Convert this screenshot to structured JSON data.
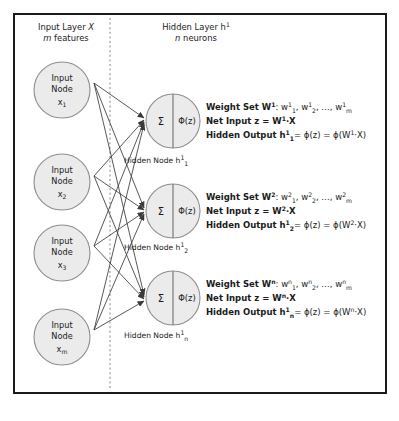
{
  "diagram": {
    "type": "neural-network-architecture",
    "headers": {
      "input_layer": {
        "line1_prefix": "Input Layer ",
        "line1_italic": "X",
        "line2_italic": "m",
        "line2_rest": " features"
      },
      "hidden_layer": {
        "line1_prefix": "Hidden Layer h",
        "line1_sup": "1",
        "line2_italic": "n",
        "line2_rest": " neurons"
      }
    },
    "input_nodes": [
      {
        "line1": "Input",
        "line2": "Node",
        "var": "x",
        "sub": "1"
      },
      {
        "line1": "Input",
        "line2": "Node",
        "var": "x",
        "sub": "2"
      },
      {
        "line1": "Input",
        "line2": "Node",
        "var": "x",
        "sub": "3"
      },
      {
        "line1": "Input",
        "line2": "Node",
        "var": "x",
        "sub": "m"
      }
    ],
    "hidden_nodes": [
      {
        "sum_symbol": "Σ",
        "activation_symbol": "Φ(z)",
        "label_prefix": "Hidden Node h",
        "label_sup": "1",
        "label_sub": "1"
      },
      {
        "sum_symbol": "Σ",
        "activation_symbol": "Φ(z)",
        "label_prefix": "Hidden Node h",
        "label_sup": "1",
        "label_sub": "2"
      },
      {
        "sum_symbol": "Σ",
        "activation_symbol": "Φ(z)",
        "label_prefix": "Hidden Node h",
        "label_sup": "1",
        "label_sub": "n"
      }
    ],
    "equation_blocks": [
      {
        "index": "1",
        "weight_label": "Weight Set W",
        "weight_sup": "1",
        "weight_colon": ": ",
        "weight_w": "w",
        "weight_list_subs": [
          "1",
          "2",
          "m"
        ],
        "weight_ellipsis": ", …, ",
        "net_label": "Net Input z = W",
        "net_sup": "1",
        "net_rest": "·X",
        "out_label": "Hidden Output h",
        "out_sup": "1",
        "out_sub": "1",
        "out_rest": "= ϕ(z) = ϕ(W",
        "out_sup2": "1",
        "out_tail": "·X)"
      },
      {
        "index": "2",
        "weight_label": "Weight Set W",
        "weight_sup": "2",
        "weight_colon": ": ",
        "weight_w": "w",
        "weight_list_subs": [
          "1",
          "2",
          "m"
        ],
        "weight_ellipsis": ", …, ",
        "net_label": "Net Input z = W",
        "net_sup": "2",
        "net_rest": "·X",
        "out_label": "Hidden Output h",
        "out_sup": "1",
        "out_sub": "2",
        "out_rest": "= ϕ(z) = ϕ(W",
        "out_sup2": "2",
        "out_tail": "·X)"
      },
      {
        "index": "n",
        "weight_label": "Weight Set W",
        "weight_sup": "n",
        "weight_colon": ": ",
        "weight_w": "w",
        "weight_list_subs": [
          "1",
          "2",
          "m"
        ],
        "weight_ellipsis": ", …, ",
        "net_label": "Net Input z = W",
        "net_sup": "n",
        "net_rest": "·X",
        "out_label": "Hidden Output h",
        "out_sup": "1",
        "out_sub": "n",
        "out_rest": "= ϕ(z) = ϕ(W",
        "out_sup2": "n",
        "out_tail": "·X)"
      }
    ],
    "colors": {
      "frame": "#1a1a1a",
      "node_fill": "#ebebeb",
      "node_stroke": "#8e8e8e",
      "edge": "#3a3a3a",
      "divider": "#9a9a9a",
      "text": "#1a1a1a"
    }
  }
}
